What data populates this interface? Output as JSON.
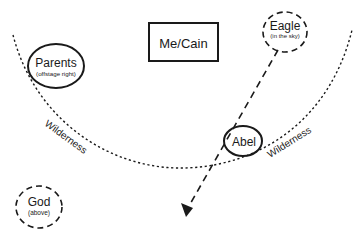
{
  "nodes": {
    "me_cain": {
      "label": "Me/Cain",
      "shape": "rectangle",
      "border": "solid"
    },
    "parents": {
      "label": "Parents",
      "sublabel": "(offstage right)",
      "shape": "ellipse",
      "border": "solid"
    },
    "eagle": {
      "label": "Eagle",
      "sublabel": "(in the sky)",
      "shape": "ellipse",
      "border": "dashed"
    },
    "abel": {
      "label": "Abel",
      "shape": "ellipse",
      "border": "solid"
    },
    "god": {
      "label": "God",
      "sublabel": "(above)",
      "shape": "ellipse",
      "border": "dashed"
    }
  },
  "boundary": {
    "style": "dotted-arc",
    "labels": [
      "Wilderness",
      "Wilderness"
    ]
  },
  "arrows": [
    {
      "from": "eagle",
      "to": "below",
      "style": "dashed",
      "head": "filled-triangle"
    }
  ],
  "colors": {
    "stroke": "#1a1a1a",
    "background": "#ffffff"
  }
}
